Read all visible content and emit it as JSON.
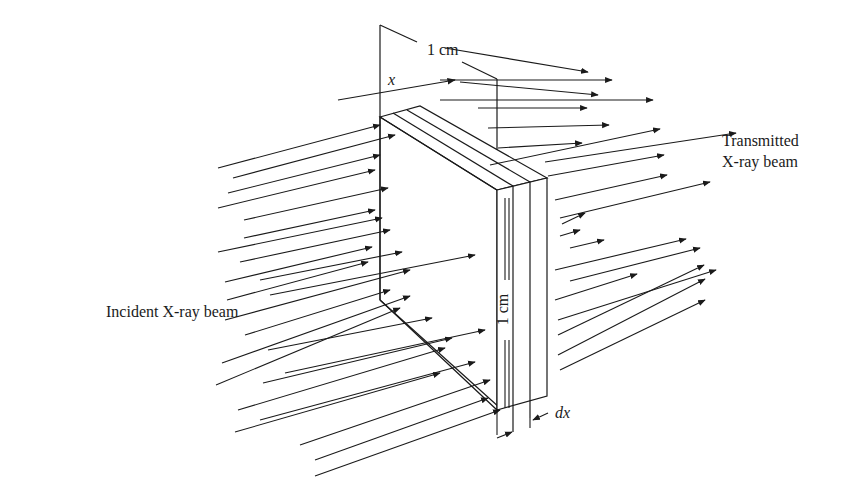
{
  "figure": {
    "type": "X-ray attenuation through a thin slab",
    "labels": {
      "incident": "Incident X-ray beam",
      "transmitted_line1": "Transmitted",
      "transmitted_line2": "X-ray beam",
      "width_dim": "1 cm",
      "height_dim": "1 cm",
      "x_var": "x",
      "thickness_var": "dx"
    },
    "colors": {
      "line": "#1a1a1a",
      "background": "#ffffff"
    },
    "incident_arrows": [
      [
        218,
        168,
        380,
        125
      ],
      [
        233,
        178,
        395,
        135
      ],
      [
        228,
        193,
        380,
        155
      ],
      [
        218,
        208,
        375,
        170
      ],
      [
        244,
        220,
        388,
        188
      ],
      [
        244,
        238,
        375,
        210
      ],
      [
        218,
        252,
        382,
        218
      ],
      [
        240,
        262,
        390,
        230
      ],
      [
        225,
        282,
        372,
        247
      ],
      [
        260,
        280,
        402,
        252
      ],
      [
        227,
        300,
        368,
        262
      ],
      [
        225,
        320,
        410,
        270
      ],
      [
        270,
        295,
        475,
        255
      ],
      [
        245,
        335,
        390,
        290
      ],
      [
        222,
        363,
        410,
        296
      ],
      [
        268,
        350,
        432,
        318
      ],
      [
        216,
        385,
        400,
        308
      ],
      [
        263,
        383,
        452,
        338
      ],
      [
        285,
        373,
        485,
        330
      ],
      [
        238,
        410,
        445,
        348
      ],
      [
        235,
        432,
        440,
        373
      ],
      [
        260,
        420,
        475,
        362
      ],
      [
        300,
        445,
        490,
        380
      ],
      [
        315,
        460,
        488,
        398
      ],
      [
        315,
        476,
        500,
        410
      ]
    ],
    "transmitted_arrows": [
      [
        445,
        48,
        588,
        72
      ],
      [
        440,
        80,
        612,
        80
      ],
      [
        460,
        82,
        598,
        95
      ],
      [
        478,
        108,
        587,
        108
      ],
      [
        440,
        100,
        653,
        100
      ],
      [
        488,
        128,
        609,
        125
      ],
      [
        498,
        148,
        582,
        143
      ],
      [
        490,
        165,
        660,
        129
      ],
      [
        545,
        162,
        736,
        133
      ],
      [
        548,
        176,
        664,
        155
      ],
      [
        555,
        200,
        667,
        175
      ],
      [
        560,
        218,
        710,
        182
      ],
      [
        562,
        224,
        585,
        213
      ],
      [
        560,
        236,
        580,
        230
      ],
      [
        570,
        248,
        604,
        240
      ],
      [
        555,
        270,
        686,
        239
      ],
      [
        570,
        281,
        700,
        248
      ],
      [
        555,
        300,
        637,
        274
      ],
      [
        558,
        320,
        716,
        270
      ],
      [
        558,
        335,
        704,
        265
      ],
      [
        558,
        355,
        705,
        279
      ],
      [
        560,
        370,
        705,
        300
      ]
    ]
  }
}
